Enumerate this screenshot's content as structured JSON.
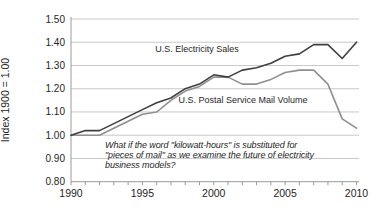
{
  "chart_data": {
    "type": "line",
    "title": "",
    "xlabel": "",
    "ylabel": "Index 1900 = 1.00",
    "ylim": [
      0.8,
      1.5
    ],
    "xlim": [
      1990,
      2010
    ],
    "yticks": [
      1.5,
      1.4,
      1.3,
      1.2,
      1.1,
      1.0,
      0.9,
      0.8
    ],
    "xticks": [
      1990,
      1995,
      2000,
      2005,
      2010
    ],
    "grid": "horizontal-light-gray",
    "legend_position": "inline-labels-on-plot",
    "x": [
      1990,
      1991,
      1992,
      1993,
      1994,
      1995,
      1996,
      1997,
      1998,
      1999,
      2000,
      2001,
      2002,
      2003,
      2004,
      2005,
      2006,
      2007,
      2008,
      2009,
      2010
    ],
    "series": [
      {
        "name": "U.S. Electricity Sales",
        "color": "#3f3f3f",
        "values": [
          1.0,
          1.02,
          1.02,
          1.05,
          1.08,
          1.11,
          1.14,
          1.16,
          1.2,
          1.22,
          1.26,
          1.25,
          1.28,
          1.29,
          1.31,
          1.34,
          1.35,
          1.39,
          1.39,
          1.33,
          1.4
        ]
      },
      {
        "name": "U.S. Postal Service Mail Volume",
        "color": "#8f8f8f",
        "values": [
          1.0,
          1.0,
          1.0,
          1.03,
          1.06,
          1.09,
          1.1,
          1.15,
          1.19,
          1.21,
          1.25,
          1.25,
          1.22,
          1.22,
          1.24,
          1.27,
          1.28,
          1.28,
          1.22,
          1.07,
          1.03
        ]
      }
    ],
    "annotation": {
      "style": "italic",
      "lines": [
        "What if the word \"kilowatt-hours\" is substituted for",
        "\"pieces of mail\" as we examine the future of electricity",
        "business models?"
      ]
    }
  },
  "colors": {
    "background": "#ffffff",
    "gridline": "#c9c9c9",
    "axis": "#9a9a9a",
    "text": "#262626",
    "series_electricity": "#3f3f3f",
    "series_mail": "#8f8f8f"
  }
}
